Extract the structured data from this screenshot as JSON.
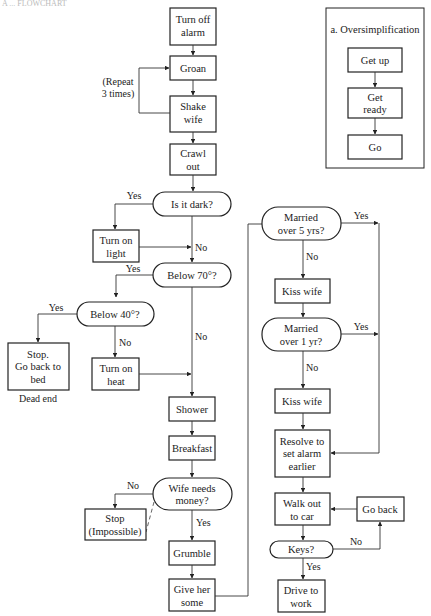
{
  "header": {
    "partial_text": "A ... FLOWCHART"
  },
  "inset": {
    "title": "a. Oversimplification",
    "steps": [
      "Get up",
      "Get ready",
      "Go"
    ]
  },
  "nodes": {
    "turn_off_alarm": [
      "Turn off",
      "alarm"
    ],
    "groan": [
      "Groan"
    ],
    "shake_wife": [
      "Shake",
      "wife"
    ],
    "crawl_out": [
      "Crawl",
      "out"
    ],
    "is_it_dark": [
      "Is it dark?"
    ],
    "turn_on_light": [
      "Turn on",
      "light"
    ],
    "below_70": [
      "Below 70°?"
    ],
    "below_40": [
      "Below 40°?"
    ],
    "stop_bed": [
      "Stop.",
      "Go back to",
      "bed"
    ],
    "turn_on_heat": [
      "Turn on",
      "heat"
    ],
    "shower": [
      "Shower"
    ],
    "breakfast": [
      "Breakfast"
    ],
    "wife_needs_money": [
      "Wife needs",
      "money?"
    ],
    "stop_impossible": [
      "Stop",
      "(Impossible)"
    ],
    "grumble": [
      "Grumble"
    ],
    "give_her_some": [
      "Give her",
      "some"
    ],
    "married_5": [
      "Married",
      "over 5 yrs?"
    ],
    "kiss_wife_1": [
      "Kiss wife"
    ],
    "married_1": [
      "Married",
      "over 1 yr?"
    ],
    "kiss_wife_2": [
      "Kiss wife"
    ],
    "resolve": [
      "Resolve to",
      "set alarm",
      "earlier"
    ],
    "walk_out": [
      "Walk out",
      "to car"
    ],
    "go_back": [
      "Go back"
    ],
    "keys": [
      "Keys?"
    ],
    "drive": [
      "Drive to",
      "work"
    ]
  },
  "labels": {
    "repeat": [
      "(Repeat",
      "3 times)"
    ],
    "dead_end": "Dead end",
    "yes": "Yes",
    "no": "No"
  }
}
